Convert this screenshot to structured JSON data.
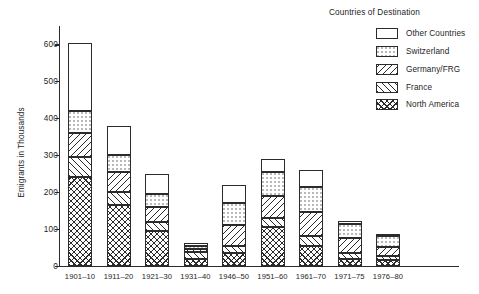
{
  "chart_data": {
    "type": "bar",
    "subtype": "stacked-bar",
    "title": "",
    "xlabel": "",
    "ylabel": "Emigrants in Thousands",
    "ylim": [
      0,
      650
    ],
    "yticks": [
      0,
      100,
      200,
      300,
      400,
      500,
      600
    ],
    "ytick_labels": [
      "0",
      "100",
      "200",
      "300",
      "400",
      "500",
      "600"
    ],
    "grid": false,
    "legend_position": "top-right",
    "legend_title": "Countries of Destination",
    "categories": [
      "1901–10",
      "1911–20",
      "1921–30",
      "1931–40",
      "1946–50",
      "1951–60",
      "1961–70",
      "1971–75",
      "1976–80"
    ],
    "series": [
      {
        "name": "North America",
        "fill": "northamerica",
        "values": [
          240,
          165,
          95,
          20,
          35,
          105,
          55,
          20,
          15
        ]
      },
      {
        "name": "France",
        "fill": "france",
        "values": [
          55,
          35,
          25,
          17,
          20,
          25,
          25,
          15,
          12
        ]
      },
      {
        "name": "Germany/FRG",
        "fill": "germany",
        "values": [
          65,
          55,
          40,
          8,
          55,
          60,
          65,
          40,
          25
        ]
      },
      {
        "name": "Switzerland",
        "fill": "switzerland",
        "values": [
          60,
          45,
          35,
          10,
          60,
          65,
          70,
          40,
          28
        ]
      },
      {
        "name": "Other Countries",
        "fill": "other",
        "values": [
          185,
          80,
          55,
          7,
          50,
          35,
          45,
          7,
          5
        ]
      }
    ],
    "totals": [
      605,
      380,
      250,
      62,
      220,
      290,
      260,
      122,
      85
    ]
  }
}
